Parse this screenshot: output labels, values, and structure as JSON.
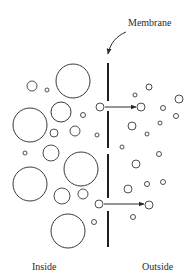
{
  "labels": {
    "membrane": "Membrane",
    "inside": "Inside",
    "outside": "Outside"
  },
  "colors": {
    "stroke": "#3a3a3a",
    "background": "#ffffff"
  },
  "membrane": {
    "x": 108,
    "segments": [
      [
        63,
        101
      ],
      [
        111,
        148
      ],
      [
        154,
        198
      ],
      [
        211,
        247
      ]
    ]
  },
  "inside_particles": [
    {
      "cx": 73,
      "cy": 81,
      "r": 17
    },
    {
      "cx": 32,
      "cy": 86,
      "r": 5
    },
    {
      "cx": 47,
      "cy": 90,
      "r": 2
    },
    {
      "cx": 30,
      "cy": 125,
      "r": 17
    },
    {
      "cx": 61,
      "cy": 112,
      "r": 10
    },
    {
      "cx": 83,
      "cy": 115,
      "r": 2.5
    },
    {
      "cx": 54,
      "cy": 133,
      "r": 4
    },
    {
      "cx": 75,
      "cy": 131,
      "r": 5
    },
    {
      "cx": 97,
      "cy": 135,
      "r": 2
    },
    {
      "cx": 25,
      "cy": 153,
      "r": 2
    },
    {
      "cx": 51,
      "cy": 153,
      "r": 8
    },
    {
      "cx": 81,
      "cy": 169,
      "r": 17
    },
    {
      "cx": 30,
      "cy": 184,
      "r": 17
    },
    {
      "cx": 62,
      "cy": 196,
      "r": 8
    },
    {
      "cx": 83,
      "cy": 194,
      "r": 5
    },
    {
      "cx": 68,
      "cy": 231,
      "r": 17
    },
    {
      "cx": 94,
      "cy": 222,
      "r": 2.5
    }
  ],
  "crossing_particles": [
    {
      "cx": 100,
      "cy": 107,
      "r": 4
    },
    {
      "cx": 99,
      "cy": 204,
      "r": 4
    }
  ],
  "outside_particles": [
    {
      "cx": 149,
      "cy": 87,
      "r": 3
    },
    {
      "cx": 135,
      "cy": 95,
      "r": 2
    },
    {
      "cx": 179,
      "cy": 99,
      "r": 4
    },
    {
      "cx": 141,
      "cy": 107,
      "r": 4
    },
    {
      "cx": 163,
      "cy": 108,
      "r": 2.5
    },
    {
      "cx": 176,
      "cy": 116,
      "r": 2.5
    },
    {
      "cx": 160,
      "cy": 123,
      "r": 2
    },
    {
      "cx": 132,
      "cy": 126,
      "r": 4
    },
    {
      "cx": 147,
      "cy": 134,
      "r": 2
    },
    {
      "cx": 122,
      "cy": 147,
      "r": 2
    },
    {
      "cx": 159,
      "cy": 154,
      "r": 2.5
    },
    {
      "cx": 136,
      "cy": 164,
      "r": 4
    },
    {
      "cx": 163,
      "cy": 182,
      "r": 2.5
    },
    {
      "cx": 147,
      "cy": 184,
      "r": 2.5
    },
    {
      "cx": 128,
      "cy": 189,
      "r": 4
    },
    {
      "cx": 149,
      "cy": 205,
      "r": 4
    },
    {
      "cx": 133,
      "cy": 217,
      "r": 2.5
    }
  ],
  "arrows": [
    {
      "x1": 105,
      "y1": 107,
      "x2": 136,
      "y2": 107
    },
    {
      "x1": 104,
      "y1": 204,
      "x2": 144,
      "y2": 204
    }
  ]
}
